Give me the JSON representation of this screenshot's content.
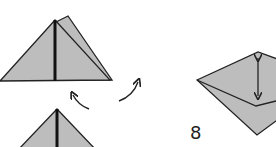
{
  "diagram": {
    "type": "origami-instructions",
    "colors": {
      "paper": "#bdbdbd",
      "outline": "#222222",
      "background": "#ffffff"
    },
    "steps": [
      {
        "id": "fold-top",
        "description": "triangle with center crease, back flap offset"
      },
      {
        "id": "fold-bottom",
        "description": "triangle with center crease (partially visible)"
      },
      {
        "id": "step-8",
        "label": "8",
        "description": "diamond-shaped fold with double-headed arrow"
      }
    ],
    "arrows": [
      {
        "id": "arrow-left",
        "kind": "curved",
        "direction": "up-left"
      },
      {
        "id": "arrow-right",
        "kind": "curved",
        "direction": "up-right"
      },
      {
        "id": "arrow-vertical",
        "kind": "double-headed",
        "direction": "vertical"
      }
    ]
  }
}
